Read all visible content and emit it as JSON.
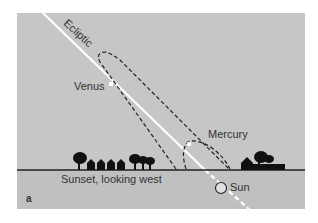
{
  "figure": {
    "panel_letter": "a",
    "ecliptic_label": "Ecliptic",
    "venus_label": "Venus",
    "mercury_label": "Mercury",
    "sun_label": "Sun",
    "horizon_caption": "Sunset, looking west",
    "colors": {
      "sky": "#c6c6c6",
      "ground": "#c0c0c0",
      "ecliptic": "#ffffff",
      "orbit_dash": "#222222",
      "horizon": "#222222",
      "silhouette": "#111111"
    }
  }
}
